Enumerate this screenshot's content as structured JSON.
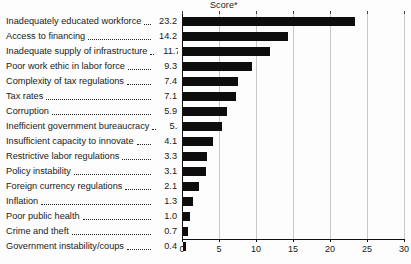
{
  "chart_data": {
    "type": "bar",
    "orientation": "horizontal",
    "title": "",
    "xlabel": "Score*",
    "ylabel": "",
    "xlim": [
      0,
      30
    ],
    "xticks": [
      0,
      5,
      10,
      15,
      20,
      25,
      30
    ],
    "grid": true,
    "legend": "none",
    "bar_color": "#0d0d0d",
    "categories": [
      "Inadequately educated workforce",
      "Access to financing",
      "Inadequate supply of infrastructure",
      "Poor work ethic in labor force",
      "Complexity of tax regulations",
      "Tax rates",
      "Corruption",
      "Inefficient government bureaucracy",
      "Insufficient capacity to innovate",
      "Restrictive labor regulations",
      "Policy instability",
      "Foreign currency regulations",
      "Inflation",
      "Poor public health",
      "Crime and theft",
      "Government instability/coups"
    ],
    "values": [
      23.2,
      14.2,
      11.7,
      9.3,
      7.4,
      7.1,
      5.9,
      5.3,
      4.1,
      3.3,
      3.1,
      2.1,
      1.3,
      1.0,
      0.7,
      0.4
    ],
    "value_labels": [
      "23.2",
      "14.2",
      "11.7",
      "9.3",
      "7.4",
      "7.1",
      "5.9",
      "5.3",
      "4.1",
      "3.3",
      "3.1",
      "2.1",
      "1.3",
      "1.0",
      "0.7",
      "0.4"
    ],
    "tick_labels": [
      "0",
      "5",
      "10",
      "15",
      "20",
      "25",
      "30"
    ]
  }
}
